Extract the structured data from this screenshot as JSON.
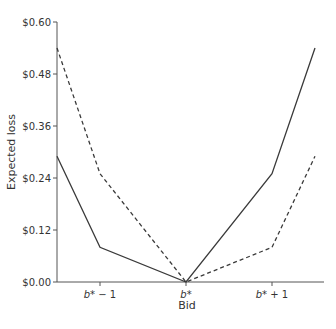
{
  "chart_data": {
    "type": "line",
    "title": "",
    "xlabel": "Bid",
    "ylabel": "Expected loss",
    "x": [
      -1.5,
      -1,
      0,
      1,
      1.5
    ],
    "x_tick_positions": [
      -1,
      0,
      1
    ],
    "x_tick_labels": [
      {
        "base": "b*",
        "suffix": " − 1"
      },
      {
        "base": "b*",
        "suffix": ""
      },
      {
        "base": "b*",
        "suffix": " + 1"
      }
    ],
    "y_ticks": [
      0,
      0.12,
      0.24,
      0.36,
      0.48,
      0.6
    ],
    "y_tick_labels": [
      "$0.00",
      "$0.12",
      "$0.24",
      "$0.36",
      "$0.48",
      "$0.60"
    ],
    "ylim": [
      0,
      0.6
    ],
    "xlim": [
      -1.5,
      1.5
    ],
    "grid": false,
    "legend": null,
    "series": [
      {
        "name": "solid",
        "style": "solid",
        "values": [
          0.29,
          0.08,
          0.0,
          0.25,
          0.54
        ]
      },
      {
        "name": "dashed",
        "style": "dashed",
        "values": [
          0.54,
          0.25,
          0.0,
          0.08,
          0.29
        ]
      }
    ]
  },
  "colors": {
    "axis": "#555555",
    "line": "#3a3a3a",
    "text": "#333333"
  }
}
